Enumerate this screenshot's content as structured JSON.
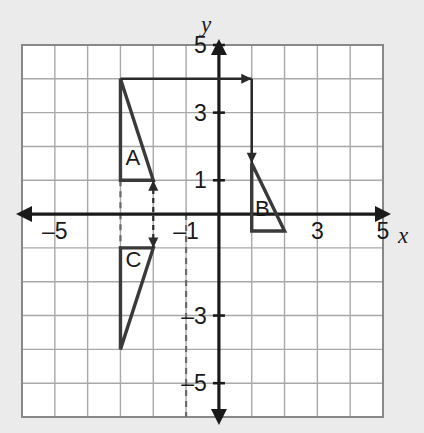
{
  "figure": {
    "background_color": "#ebebeb",
    "plot_background_color": "#ffffff",
    "grid_color": "#a0a0a0",
    "grid_border_color": "#808080",
    "axis_color": "#1a1a1a",
    "shape_color": "#3a3a3a",
    "dashed_color": "#555555"
  },
  "axes": {
    "x_axis_label": "x",
    "y_axis_label": "y",
    "x_ticks": [
      "–5",
      "–1",
      "3",
      "5"
    ],
    "y_ticks": [
      "5",
      "3",
      "1",
      "–3",
      "–5"
    ],
    "x_range": [
      -6,
      5
    ],
    "y_range": [
      -6,
      5
    ],
    "grid_on": true,
    "grid_step": 1
  },
  "chart_data": {
    "type": "scatter",
    "title": "",
    "xlabel": "x",
    "ylabel": "y",
    "xlim": [
      -6,
      5
    ],
    "ylim": [
      -6,
      5
    ],
    "grid": true,
    "x_tick_labels": [
      "–5",
      "–1",
      "3",
      "5"
    ],
    "x_tick_values": [
      -5,
      -1,
      3,
      5
    ],
    "y_tick_labels": [
      "5",
      "3",
      "1",
      "–3",
      "–5"
    ],
    "y_tick_values": [
      5,
      3,
      1,
      -3,
      -5
    ],
    "shapes": [
      {
        "name": "A",
        "label": "A",
        "label_position": [
          -2.85,
          1.45
        ],
        "type": "triangle",
        "vertices": [
          [
            -3,
            4
          ],
          [
            -3,
            1
          ],
          [
            -2,
            1
          ]
        ]
      },
      {
        "name": "B",
        "label": "B",
        "label_position": [
          1.1,
          -0.05
        ],
        "type": "triangle",
        "vertices": [
          [
            1,
            1.5
          ],
          [
            1,
            -0.5
          ],
          [
            2,
            -0.5
          ]
        ]
      },
      {
        "name": "C",
        "label": "C",
        "label_position": [
          -2.85,
          -1.55
        ],
        "type": "triangle",
        "vertices": [
          [
            -3,
            -1
          ],
          [
            -2,
            -1
          ],
          [
            -3,
            -4
          ]
        ]
      }
    ],
    "annotations": [
      {
        "name": "translation-arrow-horizontal",
        "type": "arrow",
        "from": [
          -3,
          4
        ],
        "to": [
          1,
          4
        ],
        "style": "solid",
        "heads": "end"
      },
      {
        "name": "translation-arrow-vertical",
        "type": "arrow",
        "from": [
          1,
          4
        ],
        "to": [
          1,
          1.5
        ],
        "style": "solid",
        "heads": "end"
      },
      {
        "name": "reflection-arrow-double",
        "type": "arrow",
        "from": [
          -2,
          -1
        ],
        "to": [
          -2,
          1
        ],
        "style": "dashed",
        "heads": "both"
      },
      {
        "name": "dashed-guide-left",
        "type": "line",
        "from": [
          -3,
          1
        ],
        "to": [
          -3,
          -1
        ],
        "style": "dashed"
      },
      {
        "name": "dashed-guide-y-axis-lower",
        "type": "line",
        "from": [
          -1,
          0
        ],
        "to": [
          -1,
          -6
        ],
        "style": "dashed"
      }
    ]
  }
}
